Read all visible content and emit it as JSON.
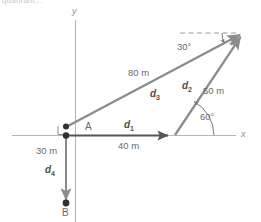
{
  "figure": {
    "cropped_header_text": "quadrant...",
    "axes": {
      "x_label": "x",
      "y_label": "y"
    },
    "points": [
      {
        "name": "A",
        "label": "A"
      },
      {
        "name": "B",
        "label": "B"
      }
    ],
    "vectors": [
      {
        "id": "d1",
        "label": "d",
        "subscript": "1",
        "magnitude": "40 m",
        "color": "#555555"
      },
      {
        "id": "d2",
        "label": "d",
        "subscript": "2",
        "magnitude": "50 m",
        "color": "#8c8c8c"
      },
      {
        "id": "d3",
        "label": "d",
        "subscript": "3",
        "magnitude": "80 m",
        "color": "#8c8c8c"
      },
      {
        "id": "d4",
        "label": "d",
        "subscript": "4",
        "magnitude": "30 m",
        "color": "#8c8c8c"
      }
    ],
    "angles": [
      {
        "id": "angle-30",
        "value": "30",
        "unit": "°",
        "text": "30°"
      },
      {
        "id": "angle-60",
        "value": "60",
        "unit": "°",
        "text": "60°"
      }
    ],
    "markers": {
      "right_angle": "right-angle-marker"
    },
    "colors": {
      "axis": "#b6b6b6",
      "vector_light": "#8c8c8c",
      "vector_dark": "#555555",
      "dashed": "#9a9a9a",
      "text": "#6a6a6a"
    }
  }
}
